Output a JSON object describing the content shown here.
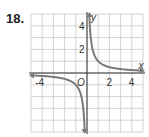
{
  "problem_number": "18.",
  "chart_data": {
    "type": "line",
    "title": "",
    "function": "y = 1/x",
    "xlabel": "x",
    "ylabel": "y",
    "origin_label": "O",
    "xlim": [
      -5,
      5
    ],
    "ylim": [
      -5,
      5
    ],
    "grid": true,
    "x_tick_labels": [
      "-4",
      "2",
      "4"
    ],
    "y_tick_labels": [
      "2",
      "4"
    ],
    "series": [
      {
        "name": "branch-right",
        "x": [
          0.2,
          0.25,
          0.5,
          1,
          2,
          3,
          4,
          5
        ],
        "y": [
          5,
          4,
          2,
          1,
          0.5,
          0.333,
          0.25,
          0.2
        ]
      },
      {
        "name": "branch-left",
        "x": [
          -5,
          -4,
          -3,
          -2,
          -1,
          -0.5,
          -0.25,
          -0.2
        ],
        "y": [
          -0.2,
          -0.25,
          -0.333,
          -0.5,
          -1,
          -2,
          -4,
          -5
        ]
      }
    ],
    "curve_color": "#7a7a7a"
  }
}
